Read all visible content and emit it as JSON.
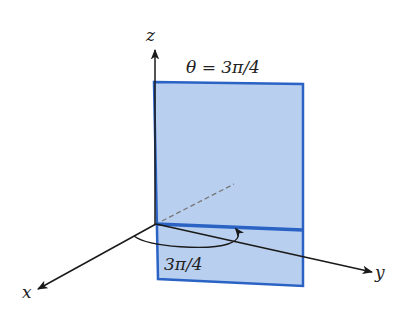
{
  "figure": {
    "title_label": "θ = 3π/4",
    "angle_label": "3π/4",
    "axes": {
      "x": "x",
      "y": "y",
      "z": "z"
    },
    "colors": {
      "plane_fill": "#b9cff0",
      "plane_edge": "#2a63c4",
      "axis": "#1a1a1a",
      "dashed": "#777777"
    }
  }
}
